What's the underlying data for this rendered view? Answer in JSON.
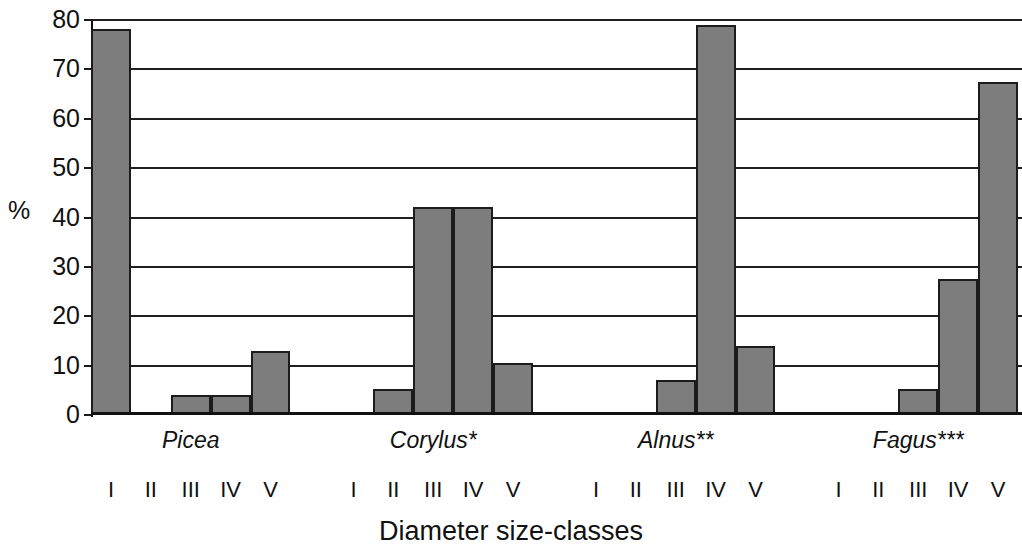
{
  "chart_data": {
    "type": "bar",
    "title": "",
    "xlabel": "Diameter size-classes",
    "ylabel": "%",
    "ylim": [
      0,
      80
    ],
    "ytick_labels": [
      "0",
      "10",
      "20",
      "30",
      "40",
      "50",
      "60",
      "70",
      "80"
    ],
    "ytick_values": [
      0,
      10,
      20,
      30,
      40,
      50,
      60,
      70,
      80
    ],
    "grid": true,
    "legend": "none",
    "categories": [
      "I",
      "II",
      "III",
      "IV",
      "V"
    ],
    "group_labels": [
      "Picea",
      "Corylus*",
      "Alnus**",
      "Fagus***"
    ],
    "series": [
      {
        "name": "Picea",
        "values": [
          78.2,
          0,
          4.1,
          4.1,
          13.0
        ]
      },
      {
        "name": "Corylus*",
        "values": [
          0,
          5.3,
          42.1,
          42.1,
          10.5
        ]
      },
      {
        "name": "Alnus**",
        "values": [
          0,
          0,
          7.1,
          78.9,
          14.0
        ]
      },
      {
        "name": "Fagus***",
        "values": [
          0,
          0,
          5.3,
          27.6,
          67.5
        ]
      }
    ],
    "colors": {
      "bar_fill": "#7d7d7d",
      "bar_edge": "#1c1c1c",
      "axis": "#111111",
      "grid": "#1f1f1f",
      "background": "#ffffff"
    }
  }
}
